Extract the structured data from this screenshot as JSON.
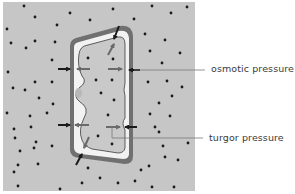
{
  "diagram": {
    "type": "plant cell in hypotonic solution",
    "colors": {
      "solution_background": "#c6c6c6",
      "cell_wall": "#707070",
      "cell_wall_inner": "#e8e8e8",
      "cytoplasm": "#f4f4f4",
      "vacuole": "#c9c9c9",
      "nucleus": "#b8b8b8",
      "solute_dot": "#1a1a1a",
      "arrow_dark": "#1a1a1a",
      "arrow_grey": "#6a6a6a",
      "leader_line": "#7a7a7a"
    }
  },
  "labels": {
    "osmotic_pressure": "osmotic pressure",
    "turgor_pressure": "turgor pressure"
  },
  "solute_dots": [
    [
      24,
      6
    ],
    [
      35,
      17
    ],
    [
      70,
      13
    ],
    [
      113,
      9
    ],
    [
      152,
      6
    ],
    [
      187,
      7
    ],
    [
      7,
      29
    ],
    [
      57,
      25
    ],
    [
      90,
      20
    ],
    [
      134,
      19
    ],
    [
      171,
      13
    ],
    [
      11,
      43
    ],
    [
      35,
      41
    ],
    [
      55,
      42
    ],
    [
      103,
      23
    ],
    [
      145,
      34
    ],
    [
      165,
      40
    ],
    [
      26,
      48
    ],
    [
      52,
      60
    ],
    [
      88,
      58
    ],
    [
      113,
      50
    ],
    [
      150,
      51
    ],
    [
      162,
      63
    ],
    [
      180,
      53
    ],
    [
      8,
      72
    ],
    [
      35,
      82
    ],
    [
      52,
      82
    ],
    [
      95,
      80
    ],
    [
      112,
      79
    ],
    [
      148,
      82
    ],
    [
      167,
      81
    ],
    [
      182,
      87
    ],
    [
      13,
      88
    ],
    [
      25,
      90
    ],
    [
      39,
      98
    ],
    [
      102,
      93
    ],
    [
      124,
      109
    ],
    [
      159,
      103
    ],
    [
      172,
      96
    ],
    [
      53,
      104
    ],
    [
      7,
      113
    ],
    [
      30,
      116
    ],
    [
      47,
      113
    ],
    [
      101,
      100
    ],
    [
      107,
      116
    ],
    [
      150,
      114
    ],
    [
      170,
      116
    ],
    [
      14,
      129
    ],
    [
      31,
      127
    ],
    [
      97,
      135
    ],
    [
      155,
      127
    ],
    [
      159,
      132
    ],
    [
      15,
      138
    ],
    [
      36,
      142
    ],
    [
      52,
      146
    ],
    [
      112,
      145
    ],
    [
      163,
      146
    ],
    [
      188,
      143
    ],
    [
      20,
      151
    ],
    [
      34,
      148
    ],
    [
      165,
      157
    ],
    [
      18,
      165
    ],
    [
      14,
      172
    ],
    [
      38,
      164
    ],
    [
      88,
      168
    ],
    [
      141,
      170
    ],
    [
      178,
      160
    ],
    [
      18,
      186
    ],
    [
      60,
      189
    ],
    [
      82,
      183
    ],
    [
      118,
      183
    ],
    [
      135,
      181
    ],
    [
      152,
      187
    ],
    [
      174,
      187
    ],
    [
      100,
      178
    ],
    [
      149,
      166
    ]
  ]
}
